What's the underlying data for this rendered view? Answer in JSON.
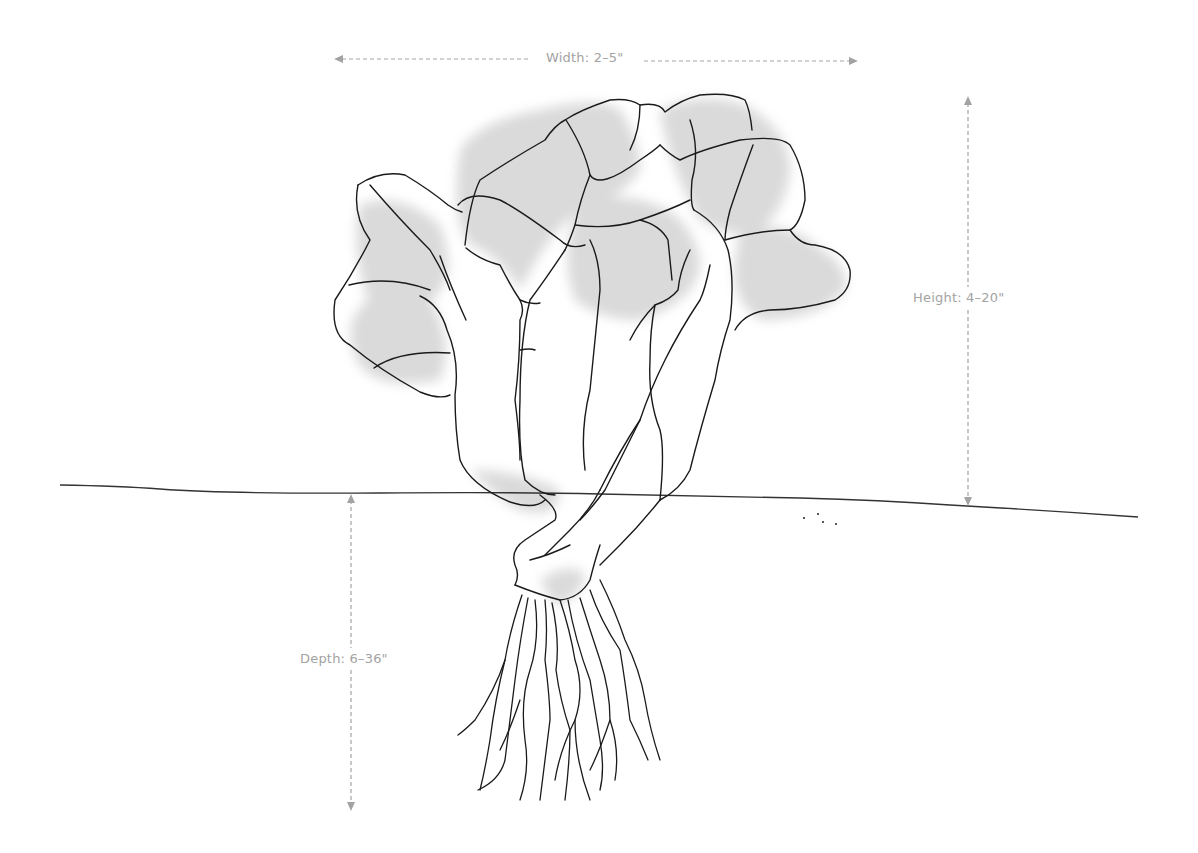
{
  "diagram": {
    "dimensions": {
      "width": {
        "label": "Width: 2–5\""
      },
      "height": {
        "label": "Height: 4–20\""
      },
      "depth": {
        "label": "Depth: 6–36\""
      }
    },
    "colors": {
      "dimension_line": "#a3a3a3",
      "outline": "#1a1a1a",
      "leaf_fill": "#d9d9d9",
      "background": "#ffffff"
    }
  }
}
